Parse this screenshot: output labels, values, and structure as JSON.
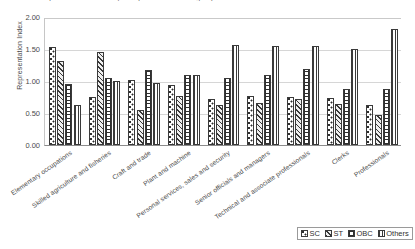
{
  "chart_data": {
    "type": "bar",
    "title": "Representation Index by occupation and social group",
    "xlabel": "",
    "ylabel": "Representation Index",
    "ylim": [
      0,
      2.0
    ],
    "yticks": [
      "0.00",
      "0.50",
      "1.00",
      "1.50",
      "2.00"
    ],
    "ytick_values": [
      0,
      0.5,
      1.0,
      1.5,
      2.0
    ],
    "grid": true,
    "legend_position": "bottom-right",
    "categories": [
      "Elementary occupations",
      "Skilled agriculture and fisheries",
      "Craft and trade",
      "Plant and machine",
      "Personal services, sales and security",
      "Senior officials and managers",
      "Technical and associate professionals",
      "Clerks",
      "Professionals"
    ],
    "series": [
      {
        "name": "SC",
        "pattern": "dotted-checker",
        "values": [
          1.53,
          0.75,
          1.01,
          0.93,
          0.72,
          0.77,
          0.75,
          0.73,
          0.62
        ]
      },
      {
        "name": "ST",
        "pattern": "diagonal-hatch",
        "values": [
          1.32,
          1.45,
          0.55,
          0.76,
          0.63,
          0.66,
          0.72,
          0.64,
          0.47
        ]
      },
      {
        "name": "OBC",
        "pattern": "crosshatch-grid",
        "values": [
          0.95,
          1.05,
          1.17,
          1.09,
          1.04,
          1.1,
          1.18,
          0.88,
          0.88
        ]
      },
      {
        "name": "Others",
        "pattern": "vertical-lines",
        "values": [
          0.63,
          1.0,
          0.97,
          1.09,
          1.57,
          1.54,
          1.55,
          1.5,
          1.81
        ]
      }
    ]
  },
  "legend": {
    "items": [
      {
        "label": "SC"
      },
      {
        "label": "ST"
      },
      {
        "label": "OBC"
      },
      {
        "label": "Others"
      }
    ]
  }
}
